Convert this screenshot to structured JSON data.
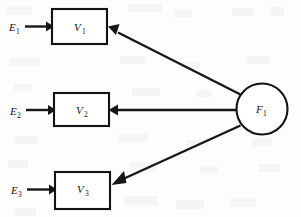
{
  "figure": {
    "kind": "path-diagram",
    "background_color": "#fdfdfc",
    "line_color": "#171717",
    "shape_fill": "#ffffff"
  },
  "latent": {
    "id": "F1",
    "label": "F",
    "subscript": "1",
    "shape": "circle",
    "cx": 262,
    "cy": 109,
    "r": 25.5
  },
  "indicators": [
    {
      "id": "V1",
      "label": "V",
      "subscript": "1",
      "shape": "rect",
      "x": 52,
      "y": 9,
      "width": 55,
      "height": 35
    },
    {
      "id": "V2",
      "label": "V",
      "subscript": "2",
      "shape": "rect",
      "x": 54,
      "y": 93,
      "width": 55,
      "height": 33
    },
    {
      "id": "V3",
      "label": "V",
      "subscript": "3",
      "shape": "rect",
      "x": 55,
      "y": 172,
      "width": 55,
      "height": 37
    }
  ],
  "errors": [
    {
      "id": "E1",
      "label": "E",
      "subscript": "1",
      "x": 9,
      "y": 27
    },
    {
      "id": "E2",
      "label": "E",
      "subscript": "2",
      "x": 10,
      "y": 111
    },
    {
      "id": "E3",
      "label": "E",
      "subscript": "3",
      "x": 11,
      "y": 190
    }
  ],
  "edges": [
    {
      "id": "E1-V1",
      "from": "E1",
      "to": "V1",
      "kind": "straight-horizontal"
    },
    {
      "id": "E2-V2",
      "from": "E2",
      "to": "V2",
      "kind": "straight-horizontal"
    },
    {
      "id": "E3-V3",
      "from": "E3",
      "to": "V3",
      "kind": "straight-horizontal"
    },
    {
      "id": "F1-V1",
      "from": "F1",
      "to": "V1",
      "kind": "diagonal-up-left"
    },
    {
      "id": "F1-V2",
      "from": "F1",
      "to": "V2",
      "kind": "straight-horizontal"
    },
    {
      "id": "F1-V3",
      "from": "F1",
      "to": "V3",
      "kind": "diagonal-down-left"
    }
  ]
}
